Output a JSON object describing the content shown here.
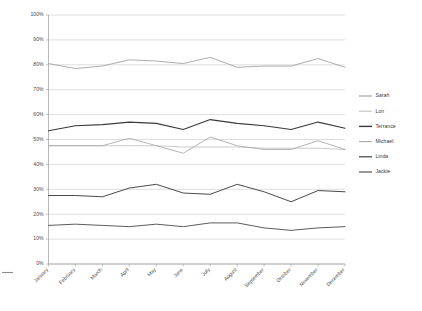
{
  "chart_data": {
    "type": "line",
    "title": "",
    "subtitle": "",
    "xlabel": "",
    "ylabel": "",
    "ylim": [
      0,
      100
    ],
    "y_unit": "%",
    "grid": true,
    "legend_position": "right",
    "categories": [
      "January",
      "February",
      "March",
      "April",
      "May",
      "June",
      "July",
      "August",
      "September",
      "October",
      "November",
      "December"
    ],
    "ytick_labels": [
      "0%",
      "10%",
      "20%",
      "30%",
      "40%",
      "50%",
      "60%",
      "70%",
      "80%",
      "90%",
      "100%"
    ],
    "ytick_values": [
      0,
      10,
      20,
      30,
      40,
      50,
      60,
      70,
      80,
      90,
      100
    ],
    "series": [
      {
        "name": "Sarah",
        "color": "#9e9e9e",
        "width": 0.85,
        "values": [
          80.5,
          78.5,
          79.5,
          82.0,
          81.5,
          80.5,
          83.0,
          79.0,
          79.5,
          79.5,
          82.5,
          79.0
        ]
      },
      {
        "name": "Lon",
        "color": "#bdbdbd",
        "width": 0.8,
        "values": [
          47.5,
          47.5,
          47.5,
          47.5,
          47.5,
          47.0,
          47.0,
          47.0,
          46.5,
          46.5,
          46.5,
          46.0
        ]
      },
      {
        "name": "Terrance",
        "color": "#3a3a3a",
        "width": 1.15,
        "values": [
          53.5,
          55.5,
          56.0,
          57.0,
          56.5,
          54.0,
          58.0,
          56.5,
          55.5,
          54.0,
          57.0,
          54.5
        ]
      },
      {
        "name": "Michael",
        "color": "#a8a8a8",
        "width": 0.85,
        "values": [
          47.5,
          47.5,
          47.5,
          50.5,
          47.5,
          44.5,
          51.0,
          47.5,
          46.0,
          46.0,
          49.5,
          46.0
        ]
      },
      {
        "name": "Linda",
        "color": "#4a4a4a",
        "width": 1.0,
        "values": [
          27.5,
          27.5,
          27.0,
          30.5,
          32.0,
          28.5,
          28.0,
          32.0,
          29.0,
          25.0,
          29.5,
          29.0
        ]
      },
      {
        "name": "Jackie",
        "color": "#5c5c5c",
        "width": 1.0,
        "values": [
          15.5,
          16.0,
          15.5,
          15.0,
          16.0,
          15.0,
          16.5,
          16.5,
          14.5,
          13.5,
          14.5,
          15.0
        ]
      }
    ]
  },
  "legend": {
    "items": [
      {
        "label": "Sarah"
      },
      {
        "label": "Lon"
      },
      {
        "label": "Terrance"
      },
      {
        "label": "Michael"
      },
      {
        "label": "Linda"
      },
      {
        "label": "Jackie"
      }
    ]
  }
}
